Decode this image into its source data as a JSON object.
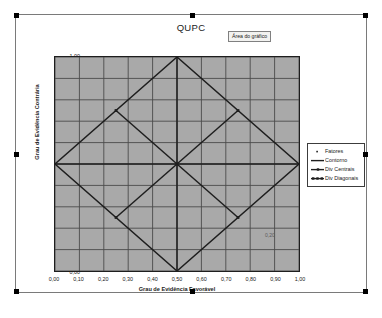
{
  "chart_object": {
    "selected": true,
    "handles": [
      "top-left",
      "top-center",
      "top-right",
      "middle-left",
      "middle-right",
      "bottom-left",
      "bottom-center",
      "bottom-right"
    ]
  },
  "plot_area_label": {
    "text": "Área do gráfico"
  },
  "colors": {
    "plot_background": "#a9a9a9",
    "gridline": "#4a4a4a",
    "series_line": "#1e1e1e",
    "chart_background": "#ffffff",
    "border": "#7a7a7a",
    "handle": "#000000"
  },
  "legend": {
    "position": "right",
    "items": [
      {
        "label": "Fatores",
        "marker": "point-marker",
        "color": "#1e1e1e"
      },
      {
        "label": "Contorno",
        "marker": "line",
        "color": "#1e1e1e"
      },
      {
        "label": "Div Centrais",
        "marker": "line-with-dot",
        "color": "#1e1e1e"
      },
      {
        "label": "Div Diagonais",
        "marker": "line-with-dots",
        "color": "#1e1e1e"
      }
    ]
  },
  "chart_data": {
    "type": "line",
    "title": "QUPC",
    "xlabel": "Grau de Evidência Favorável",
    "ylabel": "Grau de Evidência Contrária",
    "xlim": [
      0,
      1
    ],
    "ylim": [
      0,
      1
    ],
    "grid": true,
    "xticks": [
      "0,00",
      "0,10",
      "0,20",
      "0,30",
      "0,40",
      "0,50",
      "0,60",
      "0,70",
      "0,80",
      "0,90",
      "1,00"
    ],
    "yticks": [
      "0,00",
      "0,10",
      "0,20",
      "0,30",
      "0,40",
      "0,50",
      "0,60",
      "0,70",
      "0,80",
      "0,90",
      "1,00"
    ],
    "xtick_values": [
      0,
      0.1,
      0.2,
      0.3,
      0.4,
      0.5,
      0.6,
      0.7,
      0.8,
      0.9,
      1.0
    ],
    "ytick_values": [
      0,
      0.1,
      0.2,
      0.3,
      0.4,
      0.5,
      0.6,
      0.7,
      0.8,
      0.9,
      1.0
    ],
    "annotations": [
      {
        "text": "0,20",
        "x": 0.855,
        "y": 0.195
      }
    ],
    "series": [
      {
        "name": "Contorno",
        "type": "polygon",
        "points": [
          [
            0.5,
            1.0
          ],
          [
            1.0,
            0.5
          ],
          [
            0.5,
            0.0
          ],
          [
            0.0,
            0.5
          ],
          [
            0.5,
            1.0
          ]
        ]
      },
      {
        "name": "Div Centrais",
        "type": "lines",
        "segments": [
          [
            [
              0.0,
              0.5
            ],
            [
              1.0,
              0.5
            ]
          ],
          [
            [
              0.5,
              0.0
            ],
            [
              0.5,
              1.0
            ]
          ]
        ]
      },
      {
        "name": "Div Diagonais",
        "type": "lines",
        "segments": [
          [
            [
              0.25,
              0.75
            ],
            [
              0.75,
              0.25
            ]
          ],
          [
            [
              0.25,
              0.25
            ],
            [
              0.75,
              0.75
            ]
          ]
        ],
        "markers": [
          [
            0.25,
            0.75
          ],
          [
            0.75,
            0.25
          ],
          [
            0.25,
            0.25
          ],
          [
            0.75,
            0.75
          ],
          [
            0.5,
            0.5
          ]
        ]
      }
    ]
  }
}
